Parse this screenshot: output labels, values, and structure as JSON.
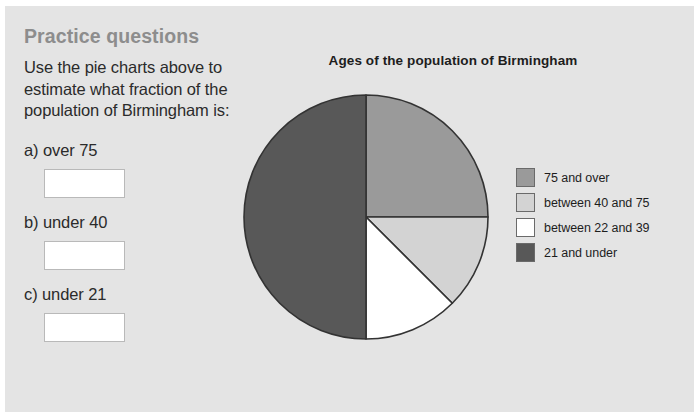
{
  "page": {
    "title": "Practice questions",
    "instructions": "Use the pie charts above to estimate what fraction of the population of Birmingham is:",
    "background_color": "#e4e4e4",
    "title_color": "#8d8d8d"
  },
  "questions": [
    {
      "label": "a) over 75",
      "answer_value": ""
    },
    {
      "label": "b) under 40",
      "answer_value": ""
    },
    {
      "label": "c) under 21",
      "answer_value": ""
    }
  ],
  "chart_data": {
    "type": "pie",
    "title": "Ages of the population of Birmingham",
    "xlabel": "",
    "ylabel": "",
    "legend_position": "right",
    "grid": false,
    "categories": [
      "75 and over",
      "between 40 and 75",
      "between 22 and 39",
      "21 and under"
    ],
    "values": [
      25,
      12.5,
      12.5,
      50
    ],
    "units": "percent",
    "start_angle_deg": 0,
    "direction": "clockwise",
    "colors": [
      "#9a9a9a",
      "#d3d3d3",
      "#ffffff",
      "#585858"
    ],
    "slice_border_color": "#333333",
    "slices": [
      {
        "label": "75 and over",
        "value": 25,
        "fraction": "1/4",
        "color": "#9a9a9a",
        "start_deg": 0,
        "end_deg": 90
      },
      {
        "label": "between 40 and 75",
        "value": 12.5,
        "fraction": "1/8",
        "color": "#d3d3d3",
        "start_deg": 90,
        "end_deg": 135
      },
      {
        "label": "between 22 and 39",
        "value": 12.5,
        "fraction": "1/8",
        "color": "#ffffff",
        "start_deg": 135,
        "end_deg": 180
      },
      {
        "label": "21 and under",
        "value": 50,
        "fraction": "1/2",
        "color": "#585858",
        "start_deg": 180,
        "end_deg": 360
      }
    ]
  }
}
